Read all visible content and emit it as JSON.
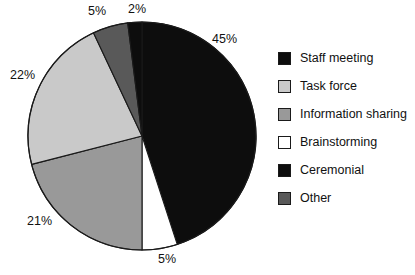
{
  "chart_data": {
    "type": "pie",
    "title": "",
    "subtitle": "",
    "xlabel": "",
    "ylabel": "",
    "legend_position": "right",
    "grid": false,
    "start_angle_deg": 0,
    "direction": "clockwise",
    "categories": [
      "Staff meeting",
      "Task force",
      "Information sharing",
      "Brainstorming",
      "Ceremonial",
      "Other"
    ],
    "values": [
      45,
      22,
      21,
      5,
      2,
      5
    ],
    "value_labels": [
      "45%",
      "22%",
      "21%",
      "5%",
      "2%",
      "5%"
    ],
    "units": "percent",
    "total": 100,
    "colors": [
      "#0d0d0d",
      "#c9c9c9",
      "#999999",
      "#ffffff",
      "#0d0d0d",
      "#595959"
    ],
    "slice_order_clockwise_from_top": [
      {
        "label": "Staff meeting",
        "value": 45,
        "value_label": "45%",
        "color": "#0d0d0d"
      },
      {
        "label": "Brainstorming",
        "value": 5,
        "value_label": "5%",
        "color": "#ffffff"
      },
      {
        "label": "Information sharing",
        "value": 21,
        "value_label": "21%",
        "color": "#999999"
      },
      {
        "label": "Task force",
        "value": 22,
        "value_label": "22%",
        "color": "#c9c9c9"
      },
      {
        "label": "Other",
        "value": 5,
        "value_label": "5%",
        "color": "#595959"
      },
      {
        "label": "Ceremonial",
        "value": 2,
        "value_label": "2%",
        "color": "#0d0d0d"
      }
    ]
  },
  "pie": {
    "outline_color": "#1a1a1a",
    "callouts": [
      {
        "name": "slice-label-staff-meeting",
        "text": "45%",
        "left": 212,
        "top": 32
      },
      {
        "name": "slice-label-brainstorming",
        "text": "5%",
        "left": 158,
        "top": 252
      },
      {
        "name": "slice-label-information-sharing",
        "text": "21%",
        "left": 27,
        "top": 214
      },
      {
        "name": "slice-label-task-force",
        "text": "22%",
        "left": 10,
        "top": 68
      },
      {
        "name": "slice-label-other",
        "text": "5%",
        "left": 88,
        "top": 4
      },
      {
        "name": "slice-label-ceremonial",
        "text": "2%",
        "left": 128,
        "top": 2
      }
    ]
  },
  "legend": {
    "items": [
      {
        "label": "Staff meeting",
        "color": "#0d0d0d",
        "name": "legend-item-staff-meeting"
      },
      {
        "label": "Task force",
        "color": "#c9c9c9",
        "name": "legend-item-task-force"
      },
      {
        "label": "Information sharing",
        "color": "#999999",
        "name": "legend-item-information-sharing"
      },
      {
        "label": "Brainstorming",
        "color": "#ffffff",
        "name": "legend-item-brainstorming"
      },
      {
        "label": "Ceremonial",
        "color": "#0d0d0d",
        "name": "legend-item-ceremonial"
      },
      {
        "label": "Other",
        "color": "#595959",
        "name": "legend-item-other"
      }
    ]
  }
}
